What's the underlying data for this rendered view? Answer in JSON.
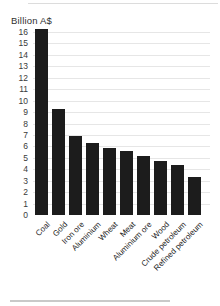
{
  "chart_data": {
    "type": "bar",
    "title": "Billion A$",
    "categories": [
      "Coal",
      "Gold",
      "Iron ore",
      "Aluminium",
      "Wheat",
      "Meat",
      "Aluminium ore",
      "Wood",
      "Crude petroleum",
      "Refined petroleum"
    ],
    "values": [
      16.3,
      9.3,
      6.9,
      6.3,
      5.9,
      5.6,
      5.2,
      4.7,
      4.4,
      3.3
    ],
    "xlabel": "",
    "ylabel": "Billion A$",
    "ylim": [
      0,
      16
    ],
    "ytick_step": 1,
    "yticks": [
      0,
      1,
      2,
      3,
      4,
      5,
      6,
      7,
      8,
      9,
      10,
      11,
      12,
      13,
      14,
      15,
      16
    ],
    "grid": true,
    "legend": "none",
    "bar_color": "#1c1c1c"
  },
  "colors": {
    "bar": "#1c1c1c",
    "grid": "#e6e6e6",
    "title_text": "#2f2f2f",
    "tick_text": "#3a3a3a",
    "label_text": "#1a1a1a",
    "rule": "#c9c9c9",
    "background": "#ffffff"
  }
}
